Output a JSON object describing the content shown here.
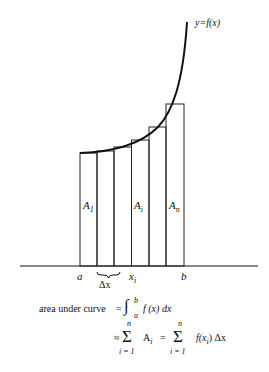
{
  "diagram": {
    "curve_label": "y=f(x)",
    "rect_labels": [
      "A",
      "A",
      "A"
    ],
    "rect_label_subs": [
      "1",
      "i",
      "n"
    ],
    "axis_labels": {
      "a": "a",
      "dx": "Δx",
      "xi": "x",
      "xi_sub": "i",
      "b": "b"
    },
    "formula": {
      "lhs": "area under curve",
      "eq1": "=",
      "integral": "∫",
      "upper": "b",
      "lower": "a",
      "integrand": "f (x) dx",
      "approx": "≈",
      "sum": "Σ",
      "sum_top": "n",
      "sum_bottom": "i = 1",
      "term1": "A",
      "term1_sub": "i",
      "eq2": "=",
      "term2": "f(x",
      "term2_sub": "i",
      "term2_end": ")  Δx"
    },
    "line_color": "#111111"
  }
}
